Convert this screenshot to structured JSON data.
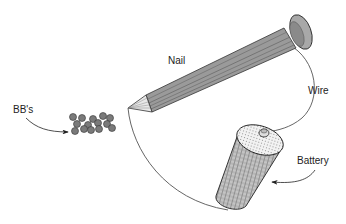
{
  "diagram": {
    "labels": {
      "nail": "Nail",
      "wire": "Wire",
      "bbs": "BB's",
      "battery": "Battery"
    },
    "colors": {
      "metal": "#9a9a9a",
      "metal_dark": "#5a5a5a",
      "bb": "#7a7a7a",
      "wire": "#555555",
      "battery_body": "#b8b8b8",
      "battery_top": "#eeeeee"
    }
  }
}
